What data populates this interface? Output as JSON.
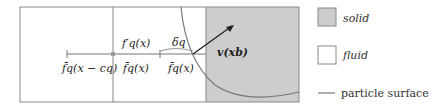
{
  "diagram": {
    "labels": {
      "f_prime": "f′q(x)",
      "delta": "δq",
      "f_left": "f̄q(x − cq)",
      "f_mid": "f̄q(x)",
      "f_right": "f̄q(x)",
      "velocity": "v(xb)"
    },
    "colors": {
      "solid": "#cdcdcd",
      "fluid": "#ffffff",
      "lines": "#666666"
    }
  },
  "legend": {
    "solid": "solid",
    "fluid": "fluid",
    "surface": "particle surface"
  }
}
